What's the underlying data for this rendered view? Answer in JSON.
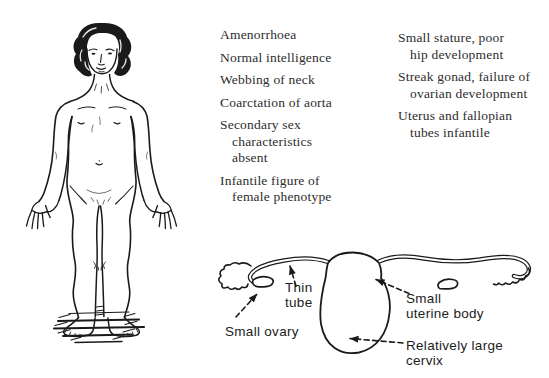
{
  "page": {
    "background": "#ffffff",
    "ink": "#1a1a1a",
    "text_color": "#2d2d2d"
  },
  "columns": {
    "left": {
      "items": [
        {
          "lines": [
            "Amenorrhoea"
          ]
        },
        {
          "lines": [
            "Normal intelligence"
          ]
        },
        {
          "lines": [
            "Webbing of neck"
          ]
        },
        {
          "lines": [
            "Coarctation of aorta"
          ]
        },
        {
          "lines": [
            "Secondary sex",
            "characteristics",
            "absent"
          ]
        },
        {
          "lines": [
            "Infantile figure of",
            "female phenotype"
          ]
        }
      ]
    },
    "right": {
      "items": [
        {
          "lines": [
            "Small stature, poor",
            "hip development"
          ]
        },
        {
          "lines": [
            "Streak gonad, failure of",
            "ovarian development"
          ]
        },
        {
          "lines": [
            "Uterus and fallopian",
            "tubes infantile"
          ]
        }
      ]
    }
  },
  "diagram": {
    "labels": {
      "thin_tube": "Thin\ntube",
      "small_ovary": "Small ovary",
      "small_uterine_body": "Small\nuterine body",
      "relatively_large_cervix": "Relatively large\ncervix"
    }
  }
}
